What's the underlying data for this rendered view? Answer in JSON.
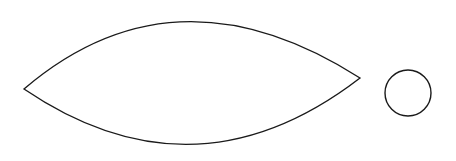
{
  "figure": {
    "width": 456,
    "height": 161,
    "background": "#ffffff",
    "stroke_color": "#1a1a1a",
    "shapes": [
      {
        "type": "lens",
        "name": "vesica-lens-shape",
        "left_tip": [
          24,
          89
        ],
        "right_tip": [
          360,
          78
        ],
        "top_control": [
          175,
          -40
        ],
        "bottom_control": [
          195,
          205
        ]
      },
      {
        "type": "circle",
        "name": "small-circle",
        "center": [
          408,
          93
        ],
        "radius": 23
      }
    ]
  }
}
